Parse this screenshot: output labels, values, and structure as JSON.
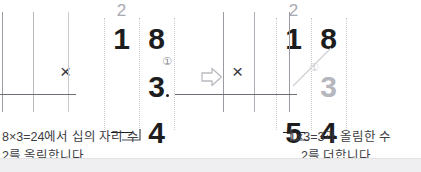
{
  "page": {
    "background": "#ffffff",
    "band_color": "#efeff1"
  },
  "arrow": {
    "glyph": "⇨",
    "name": "right-arrow"
  },
  "steps": [
    {
      "id": "step-1",
      "marker": "①",
      "carry": "2",
      "multiplicand": {
        "tens": "1",
        "ones": "8"
      },
      "multiplier": {
        "tens": "",
        "ones": "3"
      },
      "operator": "×",
      "answer": {
        "tens": "",
        "ones": "4"
      },
      "caption_line1": "8×3=24에서 십의 자리 수",
      "caption_line2": "2를 올림합니다."
    },
    {
      "id": "step-2",
      "marker": "①",
      "carry": "2",
      "multiplicand": {
        "tens": "1",
        "ones": "8"
      },
      "multiplier": {
        "tens": "",
        "ones": "3"
      },
      "operator": "×",
      "answer": {
        "tens": "5",
        "ones": "4"
      },
      "caption_line1": "1×3=3과 올림한 수",
      "caption_line2": "2를 더합니다."
    }
  ],
  "colors": {
    "digit": "#1d1d20",
    "faint_digit": "#b6b6bd",
    "carry": "#a9a9b1",
    "rule": "#6e6e76",
    "rail": "#c9c9cf",
    "caption": "#3c3c42"
  }
}
